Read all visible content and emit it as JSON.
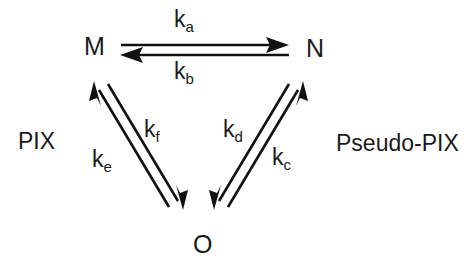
{
  "diagram": {
    "type": "kinetic-scheme",
    "title": "",
    "nodes": [
      {
        "id": "M",
        "label": "M",
        "x": 84,
        "y": 34
      },
      {
        "id": "N",
        "label": "N",
        "x": 306,
        "y": 36
      },
      {
        "id": "O",
        "label": "O",
        "x": 193,
        "y": 232
      }
    ],
    "regions": [
      {
        "id": "left",
        "label": "PIX",
        "x": 18,
        "y": 130
      },
      {
        "id": "right",
        "label": "Pseudo-PIX",
        "x": 336,
        "y": 132
      }
    ],
    "edges": [
      {
        "id": "m-to-n",
        "from": "M",
        "to": "N",
        "rate": "k",
        "subscript": "a",
        "direction": "forward",
        "label_x": 174,
        "label_y": 8
      },
      {
        "id": "n-to-m",
        "from": "N",
        "to": "M",
        "rate": "k",
        "subscript": "b",
        "direction": "reverse",
        "label_x": 174,
        "label_y": 60
      },
      {
        "id": "o-to-n",
        "from": "O",
        "to": "N",
        "rate": "k",
        "subscript": "c",
        "direction": "up-right",
        "label_x": 272,
        "label_y": 146
      },
      {
        "id": "n-to-o",
        "from": "N",
        "to": "O",
        "rate": "k",
        "subscript": "d",
        "direction": "down-left",
        "label_x": 223,
        "label_y": 118
      },
      {
        "id": "o-to-m",
        "from": "O",
        "to": "M",
        "rate": "k",
        "subscript": "e",
        "direction": "up-left",
        "label_x": 92,
        "label_y": 148
      },
      {
        "id": "m-to-o",
        "from": "M",
        "to": "O",
        "rate": "k",
        "subscript": "f",
        "direction": "down-right",
        "label_x": 144,
        "label_y": 118
      }
    ],
    "colors": {
      "stroke": "#111111",
      "text": "#1a1a1a",
      "background": "#ffffff"
    }
  }
}
